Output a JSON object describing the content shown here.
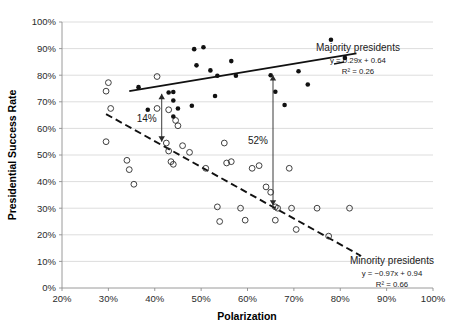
{
  "chart_data": {
    "type": "scatter",
    "title": "",
    "xlabel": "Polarization",
    "ylabel": "Presidential Success Rate",
    "xlim": [
      20,
      100
    ],
    "ylim": [
      0,
      100
    ],
    "xticks": [
      "20%",
      "30%",
      "40%",
      "50%",
      "60%",
      "70%",
      "80%",
      "90%",
      "100%"
    ],
    "yticks": [
      "0%",
      "10%",
      "20%",
      "30%",
      "40%",
      "50%",
      "60%",
      "70%",
      "80%",
      "90%",
      "100%"
    ],
    "grid": true,
    "legend_position": "inline-annotations",
    "series": [
      {
        "name": "Majority presidents",
        "marker": "filled-circle",
        "equation": "y = 0.29x + 0.64",
        "r_squared": "R² = 0.26",
        "slope": 0.29,
        "intercept": 0.64,
        "trendline": "solid",
        "points": [
          [
            36.5,
            75.5
          ],
          [
            38.5,
            67.0
          ],
          [
            43.0,
            73.5
          ],
          [
            44.0,
            73.7
          ],
          [
            44.0,
            70.5
          ],
          [
            44.0,
            64.5
          ],
          [
            45.0,
            67.5
          ],
          [
            48.5,
            89.8
          ],
          [
            50.5,
            90.5
          ],
          [
            49.0,
            83.7
          ],
          [
            48.0,
            68.5
          ],
          [
            52.0,
            81.8
          ],
          [
            53.5,
            79.8
          ],
          [
            53.0,
            72.2
          ],
          [
            56.5,
            85.3
          ],
          [
            57.5,
            79.8
          ],
          [
            65.0,
            80.0
          ],
          [
            66.0,
            73.8
          ],
          [
            68.0,
            68.8
          ],
          [
            71.0,
            81.5
          ],
          [
            73.0,
            76.5
          ],
          [
            78.0,
            93.3
          ],
          [
            81.0,
            86.5
          ]
        ]
      },
      {
        "name": "Minority presidents",
        "marker": "open-circle",
        "equation": "y = −0.97x + 0.94",
        "r_squared": "R² = 0.66",
        "slope": -0.97,
        "intercept": 0.94,
        "trendline": "dashed",
        "points": [
          [
            29.5,
            74.0
          ],
          [
            30.0,
            77.2
          ],
          [
            30.5,
            67.5
          ],
          [
            29.5,
            55.0
          ],
          [
            34.0,
            48.0
          ],
          [
            34.5,
            44.5
          ],
          [
            35.5,
            39.0
          ],
          [
            40.5,
            79.5
          ],
          [
            40.5,
            67.5
          ],
          [
            43.0,
            67.0
          ],
          [
            44.5,
            63.0
          ],
          [
            45.0,
            61.0
          ],
          [
            42.5,
            54.5
          ],
          [
            43.0,
            51.5
          ],
          [
            43.5,
            47.5
          ],
          [
            44.0,
            46.5
          ],
          [
            46.0,
            53.5
          ],
          [
            47.5,
            51.0
          ],
          [
            51.0,
            45.0
          ],
          [
            53.5,
            30.5
          ],
          [
            54.0,
            25.0
          ],
          [
            55.0,
            54.5
          ],
          [
            55.5,
            47.0
          ],
          [
            56.5,
            47.5
          ],
          [
            58.5,
            30.0
          ],
          [
            59.5,
            25.5
          ],
          [
            61.0,
            45.0
          ],
          [
            62.5,
            46.0
          ],
          [
            64.0,
            38.0
          ],
          [
            65.0,
            36.0
          ],
          [
            66.0,
            30.5
          ],
          [
            66.5,
            30.0
          ],
          [
            66.0,
            25.5
          ],
          [
            69.0,
            45.0
          ],
          [
            69.5,
            30.0
          ],
          [
            70.5,
            22.0
          ],
          [
            75.0,
            30.0
          ],
          [
            82.0,
            30.0
          ],
          [
            77.5,
            19.5
          ]
        ]
      }
    ],
    "annotations": [
      {
        "label": "14%",
        "x_position": 41.5,
        "y_top": 73.0,
        "y_bottom": 55.0,
        "type": "vertical-arrow"
      },
      {
        "label": "52%",
        "x_position": 65.5,
        "y_top": 80.0,
        "y_bottom": 31.0,
        "type": "vertical-arrow"
      }
    ]
  }
}
